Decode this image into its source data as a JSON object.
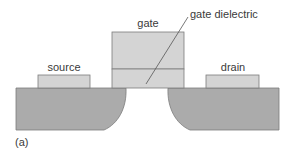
{
  "diagram": {
    "labels": {
      "gate": "gate",
      "gate_dielectric": "gate dielectric",
      "source": "source",
      "drain": "drain",
      "panel": "(a)"
    },
    "colors": {
      "substrate": "#ababab",
      "contact": "#d4d4d4",
      "outline": "#7c7c7c",
      "text": "#3a3a3a",
      "background": "#ffffff"
    }
  }
}
